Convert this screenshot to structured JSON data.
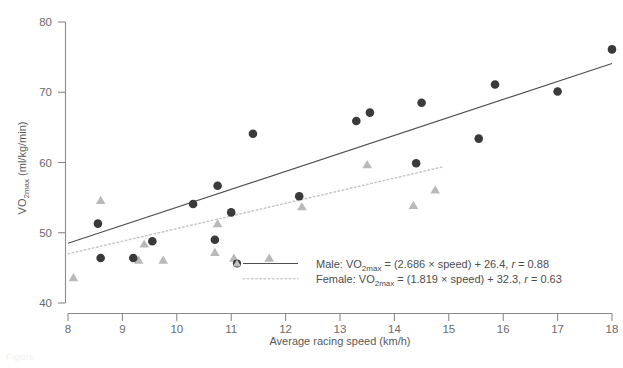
{
  "chart_data": {
    "type": "scatter",
    "title": "",
    "xlabel": "Average racing speed (km/h)",
    "ylabel": "VO2max (ml/kg/min)",
    "ylabel_parts": {
      "pre": "VO",
      "sub": "2max",
      "post": " (ml/kg/min)"
    },
    "xlim": [
      8,
      18
    ],
    "ylim": [
      40,
      80
    ],
    "xticks": [
      8,
      9,
      10,
      11,
      12,
      13,
      14,
      15,
      16,
      17,
      18
    ],
    "yticks": [
      40,
      50,
      60,
      70,
      80
    ],
    "grid": false,
    "legend_position": "inside-center-bottom",
    "series": [
      {
        "name": "Male",
        "marker": "filled-circle",
        "color": "#3a3a3a",
        "line_style": "solid",
        "equation_slope": 2.686,
        "equation_intercept": 26.4,
        "r": 0.88,
        "points": [
          {
            "x": 8.55,
            "y": 51.3
          },
          {
            "x": 8.6,
            "y": 46.4
          },
          {
            "x": 9.2,
            "y": 46.4
          },
          {
            "x": 9.55,
            "y": 48.8
          },
          {
            "x": 10.3,
            "y": 54.1
          },
          {
            "x": 10.7,
            "y": 49.0
          },
          {
            "x": 10.75,
            "y": 56.7
          },
          {
            "x": 11.0,
            "y": 52.9
          },
          {
            "x": 11.4,
            "y": 64.1
          },
          {
            "x": 12.25,
            "y": 55.2
          },
          {
            "x": 13.3,
            "y": 65.9
          },
          {
            "x": 13.55,
            "y": 67.1
          },
          {
            "x": 14.4,
            "y": 59.9
          },
          {
            "x": 14.5,
            "y": 68.5
          },
          {
            "x": 15.55,
            "y": 63.4
          },
          {
            "x": 15.85,
            "y": 71.1
          },
          {
            "x": 17.0,
            "y": 70.1
          },
          {
            "x": 18.0,
            "y": 76.1
          }
        ]
      },
      {
        "name": "Female",
        "marker": "filled-triangle",
        "color": "#b9b9b9",
        "line_style": "dotted",
        "equation_slope": 1.819,
        "equation_intercept": 32.3,
        "r": 0.63,
        "points": [
          {
            "x": 8.1,
            "y": 43.6
          },
          {
            "x": 8.6,
            "y": 54.6
          },
          {
            "x": 9.3,
            "y": 46.1
          },
          {
            "x": 9.4,
            "y": 48.4
          },
          {
            "x": 9.75,
            "y": 46.1
          },
          {
            "x": 10.7,
            "y": 47.2
          },
          {
            "x": 10.75,
            "y": 51.3
          },
          {
            "x": 11.05,
            "y": 46.4
          },
          {
            "x": 11.7,
            "y": 46.4
          },
          {
            "x": 12.3,
            "y": 53.7
          },
          {
            "x": 13.5,
            "y": 59.7
          },
          {
            "x": 14.35,
            "y": 53.9
          },
          {
            "x": 14.75,
            "y": 56.1
          }
        ]
      }
    ],
    "fit_lines": [
      {
        "name": "Male",
        "x1": 8,
        "y1": 48.5,
        "x2": 18,
        "y2": 74.1,
        "style": "solid",
        "color": "#4f4f4f"
      },
      {
        "name": "Female",
        "x1": 8,
        "y1": 47.0,
        "x2": 14.9,
        "y2": 59.4,
        "style": "dotted",
        "color": "#c7c7c7"
      }
    ]
  },
  "axes": {
    "x_title": "Average racing speed (km/h)",
    "y_title_pre": "VO",
    "y_title_sub": "2max",
    "y_title_post": " (ml/kg/min)",
    "x_tick_labels": [
      "8",
      "9",
      "10",
      "11",
      "12",
      "13",
      "14",
      "15",
      "16",
      "17",
      "18"
    ],
    "y_tick_labels": [
      "40",
      "50",
      "60",
      "70",
      "80"
    ]
  },
  "legend": {
    "male": {
      "prefix": "Male: VO",
      "sub": "2max",
      "eq_a": " = (2.686 ",
      "times": "×",
      "eq_b": " speed) + 26.4, ",
      "r_sym": "r",
      "r_val": " = 0.88"
    },
    "female": {
      "prefix": "Female: VO",
      "sub": "2max",
      "eq_a": " = (1.819 ",
      "times": "×",
      "eq_b": " speed) + 32.3, ",
      "r_sym": "r",
      "r_val": " = 0.63"
    }
  },
  "colors": {
    "male_marker": "#3a3a3a",
    "female_marker": "#b9b9b9",
    "male_line": "#4f4f4f",
    "female_line": "#c7c7c7",
    "axis": "#8a8a8a",
    "text": "#5a5a5a"
  },
  "caption": "Figure"
}
